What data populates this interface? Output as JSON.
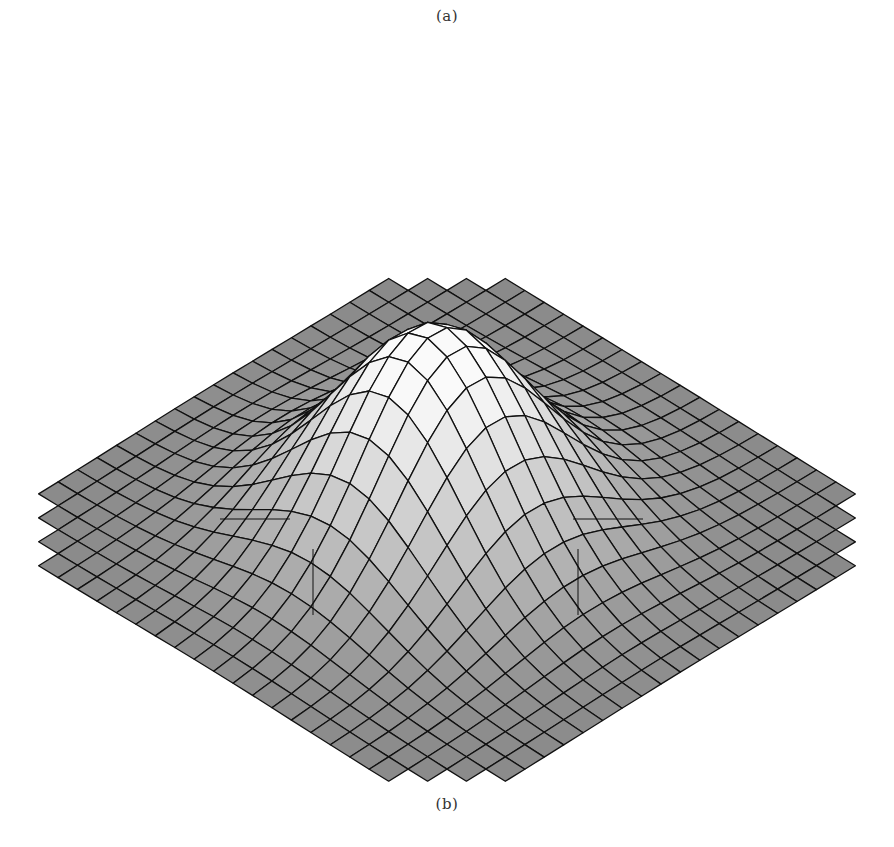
{
  "figure": {
    "caption_top": "(a)",
    "caption_bottom": "(b)"
  },
  "chart_data": {
    "type": "surface",
    "title": "",
    "xlabel": "",
    "ylabel": "",
    "zlabel": "",
    "grid_resolution": 24,
    "surface_function": "z = A * exp(-((x-x0)^2 + (y-y0)^2) / (2*sigma^2))",
    "parameters": {
      "amplitude": 1.0,
      "x0": 0.0,
      "y0": 0.05,
      "sigma": 0.32,
      "domain": [
        -1,
        1
      ]
    },
    "view": {
      "rotation_deg": 45,
      "elevation_deg": 38
    },
    "colors": {
      "base_surface": "#8a8a8a",
      "peak_highlight": "#f8f8f8",
      "grid_lines": "#111111",
      "background": "#ffffff"
    },
    "axes_markers": [
      {
        "label": "left-cross",
        "x": 290,
        "y": 519
      },
      {
        "label": "right-cross",
        "x": 643,
        "y": 519
      }
    ],
    "grid": true,
    "legend": null
  }
}
